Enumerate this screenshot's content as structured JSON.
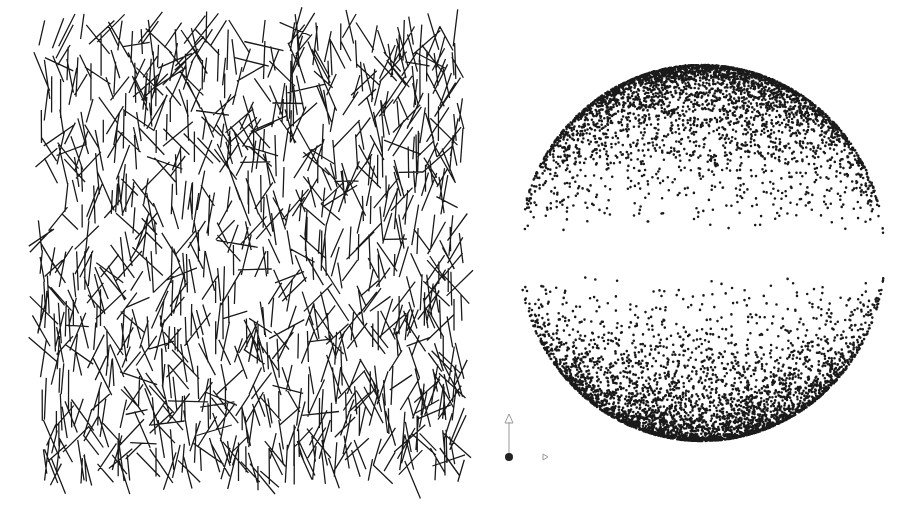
{
  "figure": {
    "background": "#ffffff",
    "ink_color": "#1a1a1a",
    "left_panel": {
      "type": "random-needles",
      "region": {
        "x0": 40,
        "y0": 25,
        "x1": 462,
        "y1": 480
      },
      "count": 1100,
      "length_min": 22,
      "length_max": 42,
      "orientation_bias": "near-vertical",
      "stroke_width": 1.3
    },
    "right_panel": {
      "type": "point-cloud-sphere",
      "center": {
        "x": 702,
        "y": 253
      },
      "radius_x": 183,
      "radius_y": 188,
      "count": 9000,
      "density": "concentrated-at-poles-and-rim, sparse equatorial band",
      "dot_radius": 1.3
    },
    "axis_gizmo": {
      "origin": {
        "x": 509,
        "y": 457
      },
      "up_arrow_tip": {
        "x": 509,
        "y": 414
      },
      "right_arrow_tip": {
        "x": 548,
        "y": 457
      },
      "arrow_color": "#9a9a9a",
      "origin_color": "#222222"
    }
  }
}
